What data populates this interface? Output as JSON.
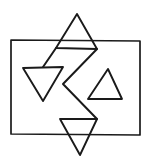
{
  "figure": {
    "background_color": "#ffffff",
    "stroke_color": "#1a1a1a",
    "canvas": {
      "width": 152,
      "height": 166
    },
    "shapes": {
      "rectangle": {
        "name": "outer-rectangle",
        "x": 11,
        "y": 40,
        "width": 129,
        "height": 95,
        "points": "11,40 140,41 140,135 11,134 11,40"
      },
      "triangle_top": {
        "name": "top-triangle",
        "orientation": "up",
        "points": "77,14 97,49 56,48 77,14"
      },
      "triangle_left": {
        "name": "left-triangle",
        "orientation": "down",
        "points": "23,68 63,67 43,101 23,68"
      },
      "triangle_right": {
        "name": "right-triangle",
        "orientation": "up",
        "points": "108,69 122,99 88,99 108,69"
      },
      "triangle_bottom": {
        "name": "bottom-triangle",
        "orientation": "down",
        "points": "60,119 97,119 80,155 60,119"
      },
      "zigzag": {
        "name": "central-zigzag",
        "description": "Z-shaped connector crossing the centre of the figure",
        "points": "97,49 63,84 97,119"
      },
      "zigzag_secondary": {
        "name": "central-zigzag-secondary",
        "description": "Second diagonal forming the X crossing at centre",
        "points": "56,48 43,67"
      }
    }
  }
}
